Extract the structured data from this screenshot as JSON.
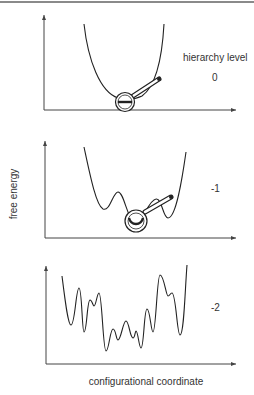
{
  "figure": {
    "y_axis_label": "free energy",
    "x_axis_label": "configurational coordinate",
    "hierarchy_title": "hierarchy level",
    "panels": [
      {
        "level": "0",
        "shape": "single parabolic well",
        "magnifier_at": "global minimum"
      },
      {
        "level": "-1",
        "shape": "rugged well with several local minima",
        "magnifier_at": "central minimum"
      },
      {
        "level": "-2",
        "shape": "highly rugged landscape with many local minima",
        "magnifier_at": "none"
      }
    ]
  },
  "colors": {
    "line": "#222222",
    "axis": "#444444",
    "text": "#333333",
    "rule": "#8a8a8a"
  }
}
